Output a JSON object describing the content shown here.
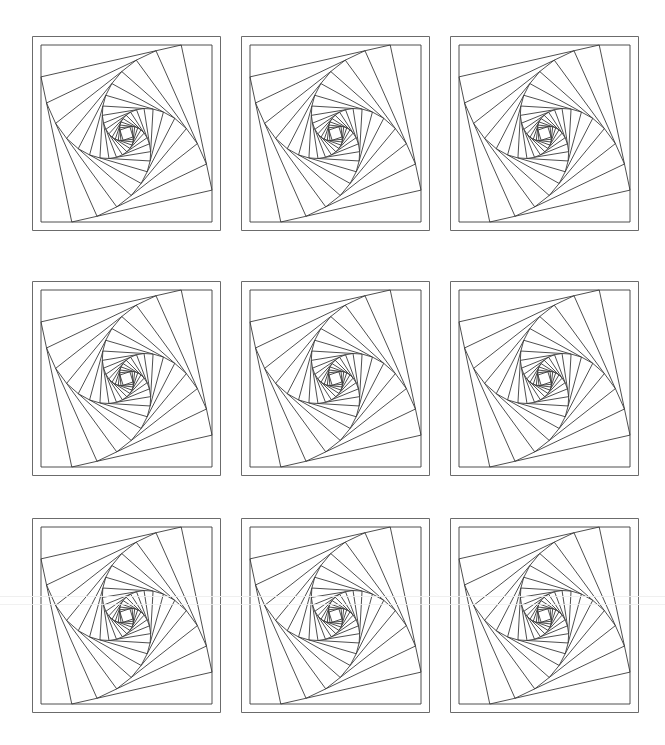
{
  "document": {
    "title": "",
    "background_color": "#ffffff",
    "width": 665,
    "height": 745
  },
  "caption": {
    "text": ""
  },
  "style": {
    "frame_stroke": "#6b6b6b",
    "spiral_stroke": "#3a3a3a",
    "artifact_color": "#ededed",
    "stroke_width": 0.9,
    "frame_stroke_width": 1
  },
  "chart_data": {
    "type": "line",
    "title": "",
    "subtitle": "",
    "xlabel": "",
    "ylabel": "",
    "grid": false,
    "legend": "none",
    "panel_count": 9,
    "rows": 3,
    "cols": 3,
    "series": [
      {
        "name": "panel-1",
        "row": 1,
        "col": 1,
        "squares": 17,
        "ratio": 0.82,
        "start_rotation_deg": 0
      },
      {
        "name": "panel-2",
        "row": 1,
        "col": 2,
        "squares": 17,
        "ratio": 0.82,
        "start_rotation_deg": 0
      },
      {
        "name": "panel-3",
        "row": 1,
        "col": 3,
        "squares": 17,
        "ratio": 0.82,
        "start_rotation_deg": 0
      },
      {
        "name": "panel-4",
        "row": 2,
        "col": 1,
        "squares": 17,
        "ratio": 0.82,
        "start_rotation_deg": 0
      },
      {
        "name": "panel-5",
        "row": 2,
        "col": 2,
        "squares": 17,
        "ratio": 0.82,
        "start_rotation_deg": 0
      },
      {
        "name": "panel-6",
        "row": 2,
        "col": 3,
        "squares": 17,
        "ratio": 0.82,
        "start_rotation_deg": 0
      },
      {
        "name": "panel-7",
        "row": 3,
        "col": 1,
        "squares": 17,
        "ratio": 0.82,
        "start_rotation_deg": 0
      },
      {
        "name": "panel-8",
        "row": 3,
        "col": 2,
        "squares": 17,
        "ratio": 0.82,
        "start_rotation_deg": 0
      },
      {
        "name": "panel-9",
        "row": 3,
        "col": 3,
        "squares": 17,
        "ratio": 0.82,
        "start_rotation_deg": 0
      }
    ],
    "ylim": [
      0,
      1
    ],
    "xlim": [
      0,
      1
    ]
  },
  "layout": {
    "panel_width": 189,
    "panel_height": 195,
    "col_x": [
      32,
      241,
      450
    ],
    "row_y": [
      36,
      281,
      518
    ],
    "inner_inset": 9,
    "num_squares": 17,
    "divide_ratio": 0.82
  },
  "artifacts": [
    {
      "name": "scan-line-left",
      "top": 596,
      "opacity": 0.9
    },
    {
      "name": "scan-line-right",
      "top": 604,
      "opacity": 0.8
    }
  ]
}
